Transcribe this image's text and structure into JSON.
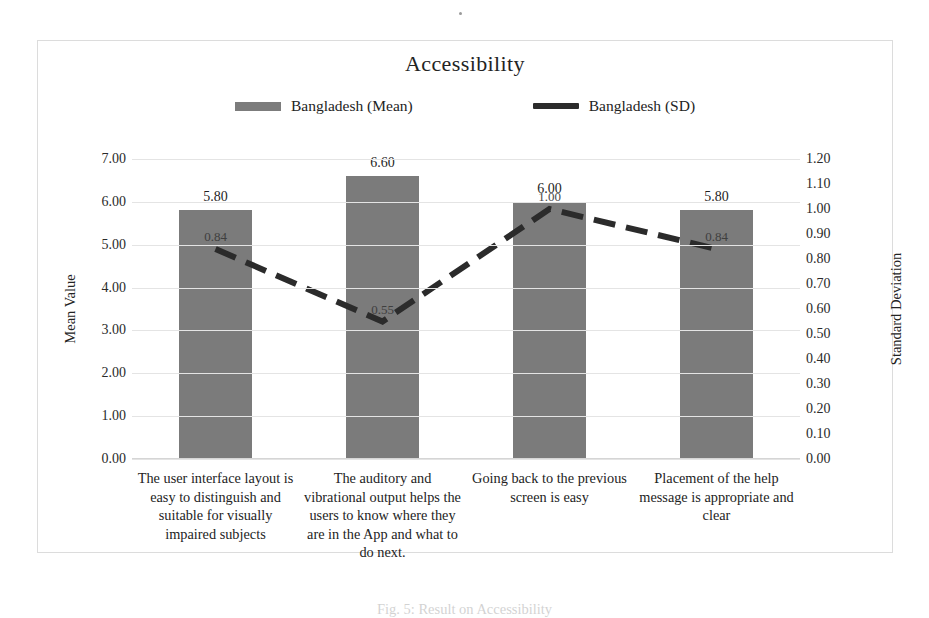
{
  "figure": {
    "caption": "Fig. 5: Result on Accessibility"
  },
  "chart_data": {
    "type": "bar",
    "title": "Accessibility",
    "xlabel": "",
    "ylabel": "Mean Value",
    "y2label": "Standard Deviation",
    "ylim": [
      0,
      7
    ],
    "y2lim": [
      0,
      1.2
    ],
    "grid": true,
    "legend_position": "top-center",
    "categories": [
      "The user interface layout is easy to distinguish and suitable for visually impaired subjects",
      "The auditory and vibrational output helps the users to know where they are in the App and what to do next.",
      "Going back to the previous screen is easy",
      "Placement of the help message is appropriate and clear"
    ],
    "series": [
      {
        "name": "Bangladesh (Mean)",
        "type": "bar",
        "axis": "left",
        "color": "#7b7b7b",
        "values": [
          5.8,
          6.6,
          6.0,
          5.8
        ],
        "labels": [
          "5.80",
          "6.60",
          "6.00",
          "5.80"
        ]
      },
      {
        "name": "Bangladesh (SD)",
        "type": "line",
        "axis": "right",
        "color": "#2b2b2b",
        "dashed": true,
        "values": [
          0.84,
          0.55,
          1.0,
          0.84
        ],
        "labels": [
          "0.84",
          "0.55",
          "1.00",
          "0.84"
        ]
      }
    ],
    "left_ticks": [
      "0.00",
      "1.00",
      "2.00",
      "3.00",
      "4.00",
      "5.00",
      "6.00",
      "7.00"
    ],
    "right_ticks": [
      "0.00",
      "0.10",
      "0.20",
      "0.30",
      "0.40",
      "0.50",
      "0.60",
      "0.70",
      "0.80",
      "0.90",
      "1.00",
      "1.10",
      "1.20"
    ]
  },
  "legend": {
    "items": [
      {
        "label": "Bangladesh (Mean)",
        "marker": "bar-swatch"
      },
      {
        "label": "Bangladesh (SD)",
        "marker": "line-swatch"
      }
    ]
  }
}
